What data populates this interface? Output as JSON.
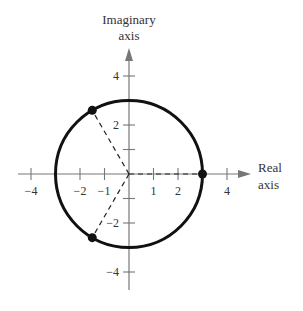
{
  "diagram": {
    "type": "complex-plane",
    "y_axis_title_line1": "Imaginary",
    "y_axis_title_line2": "axis",
    "x_axis_title_line1": "Real",
    "x_axis_title_line2": "axis",
    "x_ticks": [
      {
        "value": -4,
        "label": "−4"
      },
      {
        "value": -2,
        "label": "−2"
      },
      {
        "value": -1,
        "label": "−1"
      },
      {
        "value": 1,
        "label": "1"
      },
      {
        "value": 2,
        "label": "2"
      },
      {
        "value": 4,
        "label": "4"
      }
    ],
    "y_ticks": [
      {
        "value": 4,
        "label": "4"
      },
      {
        "value": 2,
        "label": "2"
      },
      {
        "value": 1,
        "label": ""
      },
      {
        "value": -1,
        "label": ""
      },
      {
        "value": -2,
        "label": "−2"
      },
      {
        "value": -4,
        "label": "−4"
      }
    ],
    "circle": {
      "center": [
        0,
        0
      ],
      "radius": 3
    },
    "points": [
      {
        "x": 3,
        "y": 0
      },
      {
        "x": -1.5,
        "y": 2.598
      },
      {
        "x": -1.5,
        "y": -2.598
      }
    ],
    "dashed_segments": [
      {
        "from": [
          0,
          0
        ],
        "to": [
          3,
          0
        ]
      },
      {
        "from": [
          0,
          0
        ],
        "to": [
          -1.5,
          2.598
        ]
      },
      {
        "from": [
          0,
          0
        ],
        "to": [
          -1.5,
          -2.598
        ]
      }
    ],
    "colors": {
      "axis": "#777777",
      "circle": "#111111",
      "text": "#333333",
      "background": "#ffffff"
    }
  }
}
